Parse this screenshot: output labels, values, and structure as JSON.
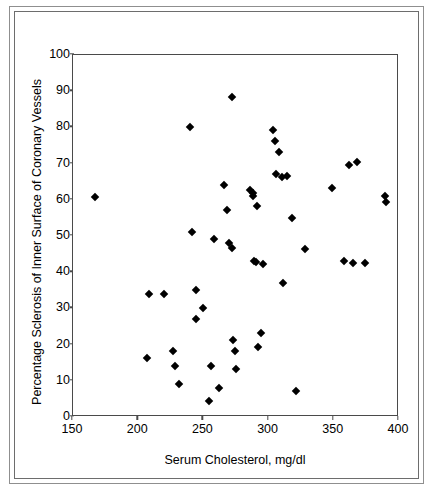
{
  "chart_data": {
    "type": "scatter",
    "title": "",
    "xlabel": "Serum Cholesterol, mg/dl",
    "ylabel": "Percentage Sclerosis of Inner Surface of Coronary Vessels",
    "xlim": [
      150,
      400
    ],
    "ylim": [
      0,
      100
    ],
    "xticks": [
      150,
      200,
      250,
      300,
      350,
      400
    ],
    "yticks": [
      0,
      10,
      20,
      30,
      40,
      50,
      60,
      70,
      80,
      90,
      100
    ],
    "grid": false,
    "legend": null,
    "marker": "diamond",
    "marker_color": "#000000",
    "points": [
      {
        "x": 167,
        "y": 60.7
      },
      {
        "x": 207,
        "y": 16.2
      },
      {
        "x": 208,
        "y": 34.0
      },
      {
        "x": 220,
        "y": 34.1
      },
      {
        "x": 227,
        "y": 18.2
      },
      {
        "x": 228,
        "y": 14.0
      },
      {
        "x": 231,
        "y": 9.0
      },
      {
        "x": 240,
        "y": 80.2
      },
      {
        "x": 241,
        "y": 51.2
      },
      {
        "x": 244,
        "y": 35.1
      },
      {
        "x": 244,
        "y": 27.2
      },
      {
        "x": 250,
        "y": 30.2
      },
      {
        "x": 254,
        "y": 4.3
      },
      {
        "x": 256,
        "y": 14.1
      },
      {
        "x": 258,
        "y": 49.1
      },
      {
        "x": 262,
        "y": 8.0
      },
      {
        "x": 266,
        "y": 64.1
      },
      {
        "x": 268,
        "y": 57.3
      },
      {
        "x": 270,
        "y": 48.2
      },
      {
        "x": 272,
        "y": 88.3
      },
      {
        "x": 272,
        "y": 46.8
      },
      {
        "x": 273,
        "y": 21.2
      },
      {
        "x": 274,
        "y": 18.2
      },
      {
        "x": 275,
        "y": 13.2
      },
      {
        "x": 286,
        "y": 62.7
      },
      {
        "x": 288,
        "y": 61.9
      },
      {
        "x": 288,
        "y": 61.1
      },
      {
        "x": 289,
        "y": 43.2
      },
      {
        "x": 290,
        "y": 42.9
      },
      {
        "x": 291,
        "y": 58.2
      },
      {
        "x": 292,
        "y": 19.4
      },
      {
        "x": 294,
        "y": 23.2
      },
      {
        "x": 296,
        "y": 42.3
      },
      {
        "x": 303,
        "y": 79.3
      },
      {
        "x": 305,
        "y": 76.2
      },
      {
        "x": 306,
        "y": 67.2
      },
      {
        "x": 308,
        "y": 73.1
      },
      {
        "x": 310,
        "y": 66.3
      },
      {
        "x": 311,
        "y": 37.1
      },
      {
        "x": 314,
        "y": 66.6
      },
      {
        "x": 318,
        "y": 55.1
      },
      {
        "x": 321,
        "y": 7.2
      },
      {
        "x": 328,
        "y": 46.3
      },
      {
        "x": 349,
        "y": 63.3
      },
      {
        "x": 358,
        "y": 43.2
      },
      {
        "x": 362,
        "y": 69.5
      },
      {
        "x": 365,
        "y": 42.6
      },
      {
        "x": 368,
        "y": 70.4
      },
      {
        "x": 374,
        "y": 42.5
      },
      {
        "x": 389,
        "y": 61.1
      },
      {
        "x": 390,
        "y": 59.4
      }
    ]
  },
  "axes": {
    "x_title": "Serum Cholesterol, mg/dl",
    "y_title": "Percentage Sclerosis of Inner Surface of Coronary Vessels",
    "x_tick_labels": [
      "150",
      "200",
      "250",
      "300",
      "350",
      "400"
    ],
    "y_tick_labels": [
      "0",
      "10",
      "20",
      "30",
      "40",
      "50",
      "60",
      "70",
      "80",
      "90",
      "100"
    ]
  },
  "colors": {
    "marker": "#000000",
    "axis": "#4a4a4a",
    "frame_outer": "#8f8f8f",
    "frame_inner": "#6d6d6d",
    "background": "#ffffff"
  }
}
